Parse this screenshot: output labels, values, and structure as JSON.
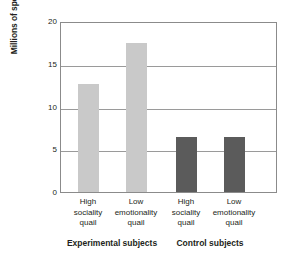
{
  "chart_data": {
    "type": "bar",
    "title": "",
    "xlabel": "",
    "ylabel": "Millions of spermatozoa per ejaculation (mean)",
    "ylim": [
      0,
      20
    ],
    "yticks": [
      0,
      5,
      10,
      15,
      20
    ],
    "ytick_labels": [
      "0",
      "5",
      "10",
      "15",
      "20"
    ],
    "grid": "horizontal",
    "legend": "none",
    "categories": [
      "High sociality quail",
      "Low emotionality quail",
      "High sociality quail",
      "Low emotionality quail"
    ],
    "category_lines": [
      [
        "High",
        "sociality",
        "quail"
      ],
      [
        "Low",
        "emotionality",
        "quail"
      ],
      [
        "High",
        "sociality",
        "quail"
      ],
      [
        "Low",
        "emotionality",
        "quail"
      ]
    ],
    "values": [
      12.6,
      17.4,
      6.4,
      6.4
    ],
    "bar_colors": [
      "#c9c9c9",
      "#c9c9c9",
      "#5b5b5b",
      "#5b5b5b"
    ],
    "groups": [
      {
        "label": "Experimental subjects",
        "bars": [
          0,
          1
        ]
      },
      {
        "label": "Control subjects",
        "bars": [
          2,
          3
        ]
      }
    ],
    "colors": {
      "experimental_bar": "#c9c9c9",
      "control_bar": "#5b5b5b",
      "axis": "#8b8b8b",
      "gridline": "#9a9a9a",
      "text": "#231f20",
      "background": "#ffffff"
    }
  }
}
